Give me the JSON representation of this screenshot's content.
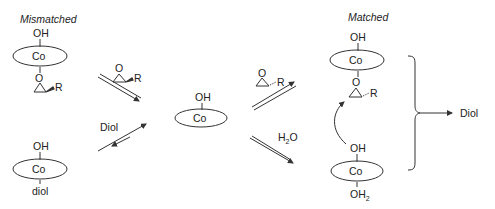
{
  "titles": {
    "left": "Mismatched",
    "right": "Matched"
  },
  "complexes": {
    "top_left": {
      "top": "OH",
      "metal": "Co",
      "bottom_ligand": "R"
    },
    "bottom_left": {
      "top": "OH",
      "metal": "Co",
      "bottom": "diol"
    },
    "center": {
      "top": "OH",
      "metal": "Co"
    },
    "top_right": {
      "top": "OH",
      "metal": "Co",
      "bottom_ligand": "R"
    },
    "bottom_right": {
      "top": "OH",
      "metal": "Co",
      "bottom": "OH",
      "bottom_sub": "2"
    }
  },
  "arrows": {
    "upper_left_epoxide_R": "R",
    "lower_left_label": "Diol",
    "upper_right_epoxide_R": "R",
    "lower_right_label": "H",
    "lower_right_label_sub": "2",
    "lower_right_label_tail": "O"
  },
  "product": {
    "label": "Diol"
  }
}
